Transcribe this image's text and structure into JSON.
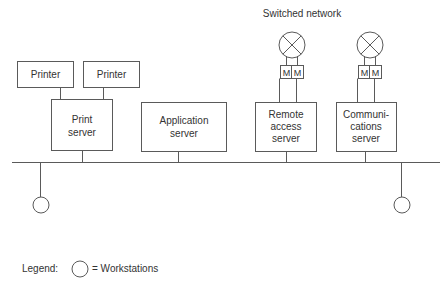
{
  "diagram": {
    "title_label": "Switched network",
    "printers": [
      {
        "label": "Printer"
      },
      {
        "label": "Printer"
      }
    ],
    "servers": {
      "print": {
        "line1": "Print",
        "line2": "server"
      },
      "application": {
        "line1": "Application",
        "line2": "server"
      },
      "remote_access": {
        "line1": "Remote",
        "line2": "access",
        "line3": "server"
      },
      "communications": {
        "line1": "Communi-",
        "line2": "cations",
        "line3": "server"
      }
    },
    "modem_label": "M",
    "legend": {
      "label": "Legend:",
      "item": "= Workstations"
    },
    "colors": {
      "stroke": "#5a5a5a",
      "text": "#333333",
      "background": "#ffffff"
    }
  }
}
